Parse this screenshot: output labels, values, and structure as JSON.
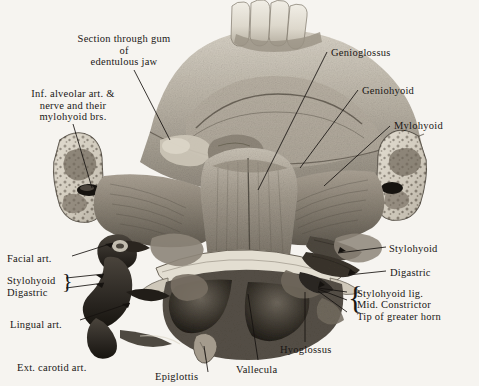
{
  "plate": {
    "title": "Dissection of floor of mouth, tongue and suprahyoid region",
    "background_color": "#f6f4f0",
    "ink_color": "#1a1715"
  },
  "labels": [
    {
      "id": "section-through-gum",
      "text": "Section through gum\nof\nedentulous jaw",
      "align": "center",
      "x": 66,
      "y": 33,
      "width": 116
    },
    {
      "id": "inf-alveolar",
      "text": "Inf. alveolar art. &\nnerve and their\nmylohyoid brs.",
      "align": "center",
      "x": 12,
      "y": 88,
      "width": 122
    },
    {
      "id": "genioglossus",
      "text": "Genioglossus",
      "align": "left",
      "x": 331,
      "y": 47,
      "width": 80
    },
    {
      "id": "geniohyoid",
      "text": "Geniohyoid",
      "align": "left",
      "x": 362,
      "y": 85,
      "width": 72
    },
    {
      "id": "mylohyoid",
      "text": "Mylohyoid",
      "align": "left",
      "x": 394,
      "y": 120,
      "width": 70
    },
    {
      "id": "stylohyoid-right",
      "text": "Stylohyoid",
      "align": "left",
      "x": 389,
      "y": 243,
      "width": 68
    },
    {
      "id": "digastric-right",
      "text": "Digastric",
      "align": "left",
      "x": 390,
      "y": 267,
      "width": 60
    },
    {
      "id": "stylohyoid-lig",
      "text": "Stylohyoid lig.",
      "align": "left",
      "x": 357,
      "y": 288,
      "width": 90
    },
    {
      "id": "mid-constrictor",
      "text": "Mid. Constrictor",
      "align": "left",
      "x": 357,
      "y": 299,
      "width": 98
    },
    {
      "id": "tip-greater-horn",
      "text": "Tip of greater horn",
      "align": "left",
      "x": 357,
      "y": 311,
      "width": 110
    },
    {
      "id": "facial-art",
      "text": "Facial art.",
      "align": "left",
      "x": 7,
      "y": 253,
      "width": 66
    },
    {
      "id": "stylohyoid-left",
      "text": "Stylohyoid",
      "align": "left",
      "x": 7,
      "y": 275,
      "width": 66
    },
    {
      "id": "digastric-left",
      "text": "Digastric",
      "align": "left",
      "x": 7,
      "y": 287,
      "width": 66
    },
    {
      "id": "lingual-art",
      "text": "Lingual art.",
      "align": "left",
      "x": 10,
      "y": 319,
      "width": 74
    },
    {
      "id": "ext-carotid-art",
      "text": "Ext. carotid art.",
      "align": "left",
      "x": 17,
      "y": 362,
      "width": 98
    },
    {
      "id": "epiglottis",
      "text": "Epiglottis",
      "align": "left",
      "x": 155,
      "y": 371,
      "width": 62
    },
    {
      "id": "vallecula",
      "text": "Vallecula",
      "align": "left",
      "x": 236,
      "y": 364,
      "width": 60
    },
    {
      "id": "hyoglossus",
      "text": "Hyoglossus",
      "align": "left",
      "x": 280,
      "y": 344,
      "width": 72
    }
  ],
  "braces": [
    {
      "id": "brace-left-stylohyoid-digastric",
      "glyph": "}",
      "x": 62,
      "y": 272,
      "size": 22
    },
    {
      "id": "brace-right-triple",
      "glyph": "{",
      "x": 348,
      "y": 285,
      "size": 31
    }
  ],
  "leaders": [
    {
      "id": "leader-section-through-gum",
      "from": [
        134,
        70
      ],
      "to": [
        170,
        140
      ]
    },
    {
      "id": "leader-inf-alveolar",
      "from": [
        73,
        124
      ],
      "to": [
        92,
        188
      ]
    },
    {
      "id": "leader-genioglossus",
      "from": [
        327,
        52
      ],
      "to": [
        258,
        190
      ]
    },
    {
      "id": "leader-geniohyoid",
      "from": [
        358,
        90
      ],
      "to": [
        300,
        168
      ]
    },
    {
      "id": "leader-mylohyoid",
      "from": [
        390,
        126
      ],
      "to": [
        324,
        186
      ]
    },
    {
      "id": "leader-stylohyoid-right",
      "from": [
        386,
        247
      ],
      "to": [
        338,
        253
      ]
    },
    {
      "id": "leader-digastric-right",
      "from": [
        386,
        271
      ],
      "to": [
        348,
        275
      ]
    },
    {
      "id": "leader-stylohyoid-lig",
      "from": [
        347,
        292
      ],
      "to": [
        318,
        290
      ]
    },
    {
      "id": "leader-mid-constrictor",
      "from": [
        347,
        300
      ],
      "to": [
        318,
        290
      ]
    },
    {
      "id": "leader-tip-greater-horn",
      "from": [
        347,
        312
      ],
      "to": [
        318,
        290
      ]
    },
    {
      "id": "leader-facial-art",
      "from": [
        72,
        256
      ],
      "to": [
        113,
        243
      ]
    },
    {
      "id": "leader-stylohyoid-left",
      "from": [
        66,
        278
      ],
      "to": [
        104,
        275
      ]
    },
    {
      "id": "leader-digastric-left",
      "from": [
        66,
        288
      ],
      "to": [
        104,
        283
      ]
    },
    {
      "id": "leader-lingual-art",
      "from": [
        80,
        320
      ],
      "to": [
        130,
        303
      ]
    },
    {
      "id": "leader-hyoglossus",
      "from": [
        305,
        342
      ],
      "to": [
        305,
        292
      ]
    },
    {
      "id": "leader-vallecula",
      "from": [
        258,
        360
      ],
      "to": [
        248,
        294
      ]
    },
    {
      "id": "leader-epiglottis",
      "from": [
        208,
        372
      ],
      "to": [
        204,
        344
      ]
    }
  ],
  "anatomy": {
    "teeth_count": 4,
    "regions": [
      "mandible arch",
      "cut ramus left",
      "cut ramus right",
      "genioglossus",
      "geniohyoid",
      "mylohyoid",
      "hyoid bone",
      "tongue base",
      "valleculae",
      "epiglottis",
      "carotid vessels"
    ]
  }
}
